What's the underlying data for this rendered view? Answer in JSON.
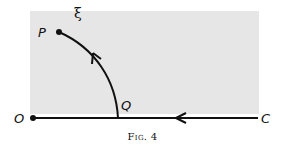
{
  "figure": {
    "caption": "Fig. 4",
    "labels": {
      "P": "P",
      "Q": "Q",
      "O": "O",
      "C": "C",
      "xi": "ξ"
    },
    "colors": {
      "stroke": "#111111",
      "shade": "#e6e6e6"
    }
  }
}
